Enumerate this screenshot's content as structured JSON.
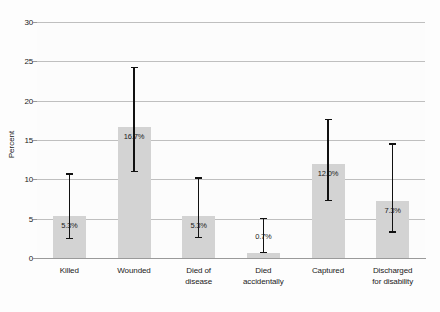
{
  "chart_data": {
    "type": "bar",
    "title": "",
    "xlabel": "",
    "ylabel": "Percent",
    "ylim": [
      0,
      30
    ],
    "yticks": [
      0,
      5,
      10,
      15,
      20,
      25,
      30
    ],
    "ytick_labels": [
      "0",
      "5",
      "10",
      "15",
      "20",
      "25",
      "30"
    ],
    "grid": true,
    "legend": "none",
    "error_bar_type": "confidence interval",
    "categories": [
      "Killed",
      "Wounded",
      "Died of disease",
      "Died accidentally",
      "Captured",
      "Discharged for disability"
    ],
    "category_lines": [
      [
        "Killed"
      ],
      [
        "Wounded"
      ],
      [
        "Died of",
        "disease"
      ],
      [
        "Died",
        "accidentally"
      ],
      [
        "Captured"
      ],
      [
        "Discharged",
        "for disability"
      ]
    ],
    "values": [
      5.3,
      16.7,
      5.3,
      0.7,
      12.0,
      7.3
    ],
    "value_labels": [
      "5.3%",
      "16.7%",
      "5.3%",
      "0.7%",
      "12.0%",
      "7.3%"
    ],
    "error_low": [
      2.5,
      11.0,
      2.6,
      0.7,
      7.3,
      3.3
    ],
    "error_high": [
      10.7,
      24.2,
      10.2,
      5.0,
      17.6,
      14.5
    ],
    "colors": {
      "bar_fill": "#d3d3d3",
      "error_bar": "#111111",
      "gridline": "#bfbfbf",
      "axis": "#9a9a9a",
      "text": "#1a1a1a",
      "background": "#fdfdfd"
    }
  }
}
